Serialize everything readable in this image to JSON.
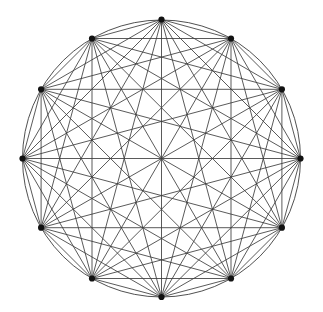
{
  "figure": {
    "background_color": "#ffffff",
    "edge_color": "#3c3c3c",
    "vertex_color": "#121212",
    "canvas_width": 323,
    "canvas_height": 312
  },
  "chart_data": {
    "type": "scatter",
    "subtitle": "",
    "xlabel": "",
    "ylabel": "",
    "grid": false,
    "legend": "none",
    "xlim": [
      0,
      323
    ],
    "ylim": [
      0,
      312
    ],
    "graph": {
      "name": "K12",
      "vertex_count": 12,
      "edge_count": 66,
      "degree_per_vertex": 11,
      "layout": "circular",
      "center": [
        161.5,
        158.5
      ],
      "radius_x": 139.0,
      "radius_y": 138.5,
      "start_angle_deg": 90,
      "angle_step_deg": 30,
      "vertex_marker_radius": 3.1,
      "circumscribed_circle_drawn": true
    },
    "vertices": [
      {
        "id": 0,
        "angle_deg": 90,
        "x": 161.5,
        "y": 19.5
      },
      {
        "id": 1,
        "angle_deg": 60,
        "x": 231.0,
        "y": 38.5
      },
      {
        "id": 2,
        "angle_deg": 30,
        "x": 281.9,
        "y": 89.3
      },
      {
        "id": 3,
        "angle_deg": 0,
        "x": 300.5,
        "y": 158.5
      },
      {
        "id": 4,
        "angle_deg": 330,
        "x": 281.9,
        "y": 227.7
      },
      {
        "id": 5,
        "angle_deg": 300,
        "x": 231.0,
        "y": 278.5
      },
      {
        "id": 6,
        "angle_deg": 270,
        "x": 161.5,
        "y": 297.0
      },
      {
        "id": 7,
        "angle_deg": 240,
        "x": 92.0,
        "y": 278.5
      },
      {
        "id": 8,
        "angle_deg": 210,
        "x": 41.1,
        "y": 227.7
      },
      {
        "id": 9,
        "angle_deg": 180,
        "x": 22.5,
        "y": 158.5
      },
      {
        "id": 10,
        "angle_deg": 150,
        "x": 41.1,
        "y": 89.3
      },
      {
        "id": 11,
        "angle_deg": 120,
        "x": 92.0,
        "y": 38.5
      }
    ],
    "edges": [
      [
        0,
        1
      ],
      [
        0,
        2
      ],
      [
        0,
        3
      ],
      [
        0,
        4
      ],
      [
        0,
        5
      ],
      [
        0,
        6
      ],
      [
        0,
        7
      ],
      [
        0,
        8
      ],
      [
        0,
        9
      ],
      [
        0,
        10
      ],
      [
        0,
        11
      ],
      [
        1,
        2
      ],
      [
        1,
        3
      ],
      [
        1,
        4
      ],
      [
        1,
        5
      ],
      [
        1,
        6
      ],
      [
        1,
        7
      ],
      [
        1,
        8
      ],
      [
        1,
        9
      ],
      [
        1,
        10
      ],
      [
        1,
        11
      ],
      [
        2,
        3
      ],
      [
        2,
        4
      ],
      [
        2,
        5
      ],
      [
        2,
        6
      ],
      [
        2,
        7
      ],
      [
        2,
        8
      ],
      [
        2,
        9
      ],
      [
        2,
        10
      ],
      [
        2,
        11
      ],
      [
        3,
        4
      ],
      [
        3,
        5
      ],
      [
        3,
        6
      ],
      [
        3,
        7
      ],
      [
        3,
        8
      ],
      [
        3,
        9
      ],
      [
        3,
        10
      ],
      [
        3,
        11
      ],
      [
        4,
        5
      ],
      [
        4,
        6
      ],
      [
        4,
        7
      ],
      [
        4,
        8
      ],
      [
        4,
        9
      ],
      [
        4,
        10
      ],
      [
        4,
        11
      ],
      [
        5,
        6
      ],
      [
        5,
        7
      ],
      [
        5,
        8
      ],
      [
        5,
        9
      ],
      [
        5,
        10
      ],
      [
        5,
        11
      ],
      [
        6,
        7
      ],
      [
        6,
        8
      ],
      [
        6,
        9
      ],
      [
        6,
        10
      ],
      [
        6,
        11
      ],
      [
        7,
        8
      ],
      [
        7,
        9
      ],
      [
        7,
        10
      ],
      [
        7,
        11
      ],
      [
        8,
        9
      ],
      [
        8,
        10
      ],
      [
        8,
        11
      ],
      [
        9,
        10
      ],
      [
        9,
        11
      ],
      [
        10,
        11
      ]
    ]
  }
}
